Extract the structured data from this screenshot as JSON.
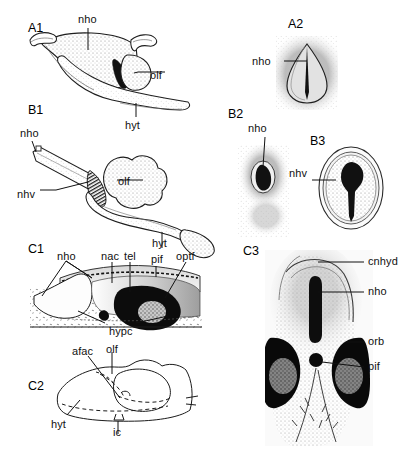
{
  "figure": {
    "background": "#ffffff",
    "ink": "#1a1a1a",
    "width": 415,
    "height": 449
  },
  "panels": [
    {
      "id": "A1",
      "x": 28,
      "y": 22,
      "view": "lateral section",
      "labels": [
        "nho",
        "olf",
        "hyt"
      ]
    },
    {
      "id": "A2",
      "x": 288,
      "y": 18,
      "view": "frontal view",
      "labels": [
        "nho"
      ]
    },
    {
      "id": "B1",
      "x": 28,
      "y": 104,
      "view": "lateral section",
      "labels": [
        "nho",
        "nhv",
        "olf",
        "hyt"
      ]
    },
    {
      "id": "B2",
      "x": 228,
      "y": 108,
      "view": "frontal view",
      "labels": [
        "nho"
      ]
    },
    {
      "id": "B3",
      "x": 310,
      "y": 135,
      "view": "frontal view",
      "labels": [
        "nhv"
      ]
    },
    {
      "id": "C1",
      "x": 28,
      "y": 243,
      "view": "sagittal section",
      "labels": [
        "nho",
        "nac",
        "tel",
        "pif",
        "optf",
        "hypc"
      ]
    },
    {
      "id": "C2",
      "x": 28,
      "y": 380,
      "view": "line diagram",
      "labels": [
        "afac",
        "olf",
        "hyt",
        "ic"
      ]
    },
    {
      "id": "C3",
      "x": 243,
      "y": 245,
      "view": "dorsal view",
      "labels": [
        "cnhyd",
        "nho",
        "orb",
        "pif"
      ]
    }
  ],
  "annotations": [
    {
      "key": "a1-nho",
      "text": "nho",
      "x": 78,
      "y": 14,
      "panel": "A1"
    },
    {
      "key": "a1-olf",
      "text": "olf",
      "x": 150,
      "y": 70,
      "panel": "A1"
    },
    {
      "key": "a1-hyt",
      "text": "hyt",
      "x": 125,
      "y": 120,
      "panel": "A1"
    },
    {
      "key": "a2-nho",
      "text": "nho",
      "x": 252,
      "y": 56,
      "panel": "A2"
    },
    {
      "key": "b1-nho",
      "text": "nho",
      "x": 20,
      "y": 128,
      "panel": "B1"
    },
    {
      "key": "b1-nhv",
      "text": "nhv",
      "x": 17,
      "y": 189,
      "panel": "B1"
    },
    {
      "key": "b1-olf",
      "text": "olf",
      "x": 118,
      "y": 176,
      "panel": "B1"
    },
    {
      "key": "b1-hyt",
      "text": "hyt",
      "x": 152,
      "y": 238,
      "panel": "B1"
    },
    {
      "key": "b2-nho",
      "text": "nho",
      "x": 248,
      "y": 123,
      "panel": "B2"
    },
    {
      "key": "b3-nhv",
      "text": "nhv",
      "x": 289,
      "y": 168,
      "panel": "B3"
    },
    {
      "key": "c1-nho",
      "text": "nho",
      "x": 57,
      "y": 251,
      "panel": "C1"
    },
    {
      "key": "c1-nac",
      "text": "nac",
      "x": 101,
      "y": 251,
      "panel": "C1"
    },
    {
      "key": "c1-tel",
      "text": "tel",
      "x": 124,
      "y": 251,
      "panel": "C1"
    },
    {
      "key": "c1-pif",
      "text": "pif",
      "x": 151,
      "y": 254,
      "panel": "C1"
    },
    {
      "key": "c1-optf",
      "text": "optf",
      "x": 176,
      "y": 251,
      "panel": "C1"
    },
    {
      "key": "c1-hypc",
      "text": "hypc",
      "x": 109,
      "y": 326,
      "panel": "C1"
    },
    {
      "key": "c2-afac",
      "text": "afac",
      "x": 72,
      "y": 346,
      "panel": "C2"
    },
    {
      "key": "c2-olf",
      "text": "olf",
      "x": 106,
      "y": 344,
      "panel": "C2"
    },
    {
      "key": "c2-hyt",
      "text": "hyt",
      "x": 51,
      "y": 419,
      "panel": "C2"
    },
    {
      "key": "c2-ic",
      "text": "ic",
      "x": 113,
      "y": 427,
      "panel": "C2"
    },
    {
      "key": "c3-cnhyd",
      "text": "cnhyd",
      "x": 368,
      "y": 258,
      "panel": "C3"
    },
    {
      "key": "c3-nho",
      "text": "nho",
      "x": 368,
      "y": 287,
      "panel": "C3"
    },
    {
      "key": "c3-orb",
      "text": "orb",
      "x": 368,
      "y": 338,
      "panel": "C3"
    },
    {
      "key": "c3-pif",
      "text": "pif",
      "x": 368,
      "y": 363,
      "panel": "C3"
    }
  ]
}
